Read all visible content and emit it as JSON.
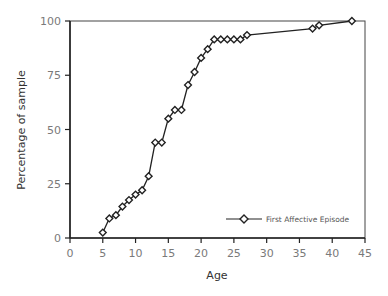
{
  "chart_data": {
    "type": "line",
    "title": "",
    "xlabel": "Age",
    "ylabel": "Percentage of sample",
    "xlim": [
      0,
      45
    ],
    "ylim": [
      0,
      100
    ],
    "x_ticks": [
      0,
      5,
      10,
      15,
      20,
      25,
      30,
      35,
      40,
      45
    ],
    "y_ticks": [
      0,
      25,
      50,
      75,
      100
    ],
    "grid": false,
    "legend_position": "lower right",
    "series": [
      {
        "name": "First Affective Episode",
        "marker": "diamond",
        "color": "#222222",
        "points": [
          {
            "x": 5,
            "y": 2.5
          },
          {
            "x": 6,
            "y": 9
          },
          {
            "x": 7,
            "y": 10.5
          },
          {
            "x": 8,
            "y": 14.5
          },
          {
            "x": 9,
            "y": 17.5
          },
          {
            "x": 10,
            "y": 20
          },
          {
            "x": 11,
            "y": 22
          },
          {
            "x": 12,
            "y": 28.5
          },
          {
            "x": 13,
            "y": 44
          },
          {
            "x": 14,
            "y": 44
          },
          {
            "x": 15,
            "y": 55
          },
          {
            "x": 16,
            "y": 59
          },
          {
            "x": 17,
            "y": 59
          },
          {
            "x": 18,
            "y": 70.5
          },
          {
            "x": 19,
            "y": 76.5
          },
          {
            "x": 20,
            "y": 83
          },
          {
            "x": 21,
            "y": 87
          },
          {
            "x": 22,
            "y": 91.5
          },
          {
            "x": 23,
            "y": 91.5
          },
          {
            "x": 24,
            "y": 91.5
          },
          {
            "x": 25,
            "y": 91.5
          },
          {
            "x": 26,
            "y": 91.5
          },
          {
            "x": 27,
            "y": 93.5
          },
          {
            "x": 37,
            "y": 96.5
          },
          {
            "x": 38,
            "y": 98
          },
          {
            "x": 43,
            "y": 100
          }
        ]
      }
    ]
  },
  "labels": {
    "xlabel": "Age",
    "ylabel": "Percentage of sample",
    "legend": "First Affective Episode"
  }
}
